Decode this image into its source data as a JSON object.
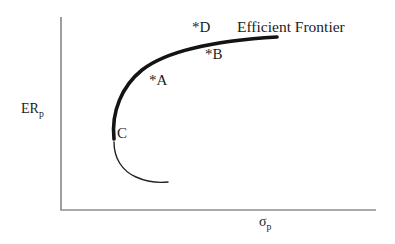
{
  "figure": {
    "title": "Efficient Frontier",
    "y_axis": {
      "label": "ER",
      "sub": "p"
    },
    "x_axis": {
      "label": "σ",
      "sub": "p"
    },
    "points": {
      "d": {
        "label": "*D"
      },
      "b": {
        "label": "*B"
      },
      "a": {
        "label": "*A"
      },
      "c": {
        "label": "C"
      }
    },
    "colors": {
      "curve": "#141414",
      "axis": "#8d8d8d",
      "text": "#1c1c1c",
      "background": "#ffffff"
    }
  },
  "geometry": {
    "axes_path": "M 61 17 L 61 210 L 376 210",
    "efficient_curve_path": "M 114 139 C 111 112 122 86 142 70 C 165 52 210 41 277 37",
    "inefficient_curve_path": "M 114 142 C 114 158 122 171 136 177 C 147 182 159 183 168 182"
  },
  "chart_data": {
    "type": "line",
    "title": "Efficient Frontier",
    "xlabel": "σp",
    "ylabel": "ERp",
    "axes_numeric": false,
    "grid": false,
    "xlim": [
      0,
      1
    ],
    "ylim": [
      0,
      1
    ],
    "series": [
      {
        "name": "Efficient Frontier (bold upper branch)",
        "style": "thick",
        "x": [
          0.168,
          0.175,
          0.2,
          0.241,
          0.308,
          0.41,
          0.537,
          0.686
        ],
        "y": [
          0.368,
          0.466,
          0.58,
          0.684,
          0.772,
          0.834,
          0.876,
          0.896
        ]
      },
      {
        "name": "Inefficient lower branch",
        "style": "thin",
        "x": [
          0.168,
          0.178,
          0.2,
          0.244,
          0.295,
          0.34
        ],
        "y": [
          0.352,
          0.269,
          0.207,
          0.166,
          0.145,
          0.145
        ]
      }
    ],
    "annotations": [
      {
        "label": "*D",
        "x": 0.429,
        "y": 0.943
      },
      {
        "label": "*B",
        "x": 0.476,
        "y": 0.803
      },
      {
        "label": "*A",
        "x": 0.295,
        "y": 0.658
      },
      {
        "label": "C",
        "x": 0.19,
        "y": 0.394
      },
      {
        "label": "Efficient Frontier",
        "x": 0.56,
        "y": 0.97
      }
    ]
  }
}
